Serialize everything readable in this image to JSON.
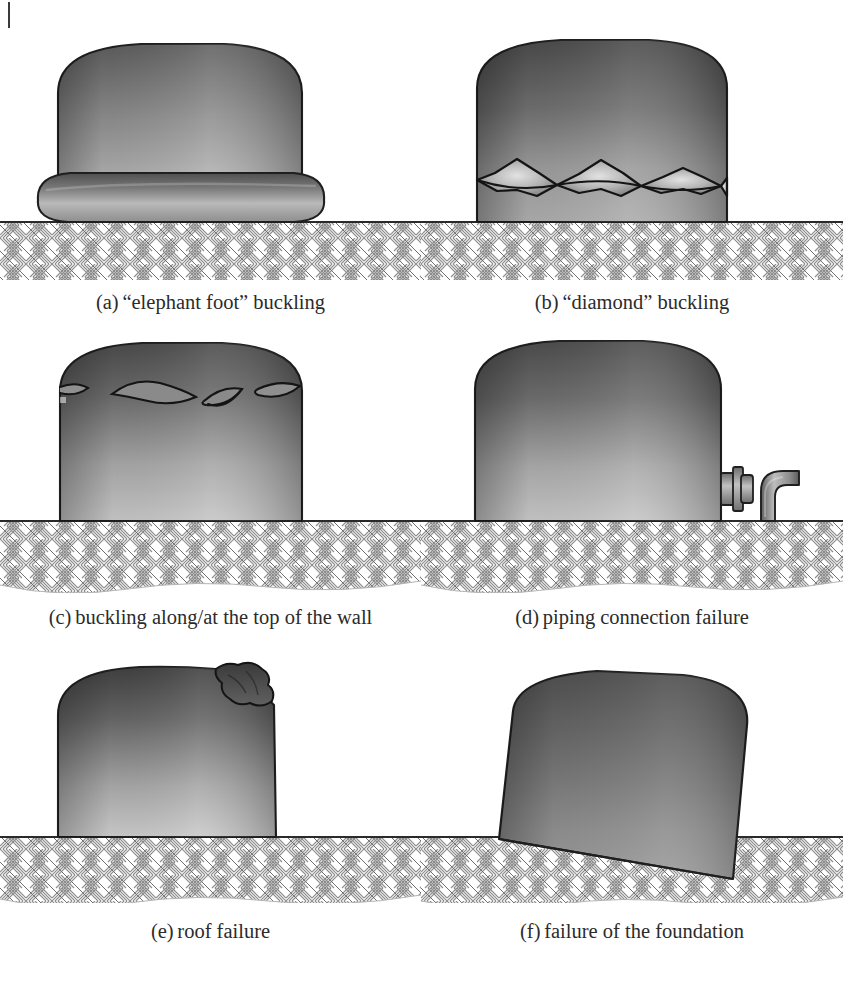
{
  "page": {
    "running_head": "",
    "rule_mark": "vertical-bar"
  },
  "figure": {
    "panel_count": 6,
    "ground_pattern": "basket-weave hatch",
    "colors": {
      "tank_dark": "#565656",
      "tank_mid": "#8a8a8a",
      "tank_light": "#c9c9c9",
      "outline": "#1f1f1f",
      "ground_line": "#2a2a2a",
      "hatch": "#8d8d8d",
      "pipe": "#9a9a9a",
      "background": "#ffffff"
    },
    "panels": [
      {
        "id": "a",
        "label": "(a)",
        "caption": "“elephant foot” buckling",
        "failure_mode": "elephant-foot-buckling",
        "feature": "torus bulge at base of shell"
      },
      {
        "id": "b",
        "label": "(b)",
        "caption": "“diamond” buckling",
        "failure_mode": "diamond-buckling",
        "feature": "chain of diamond lobes around lower shell"
      },
      {
        "id": "c",
        "label": "(c)",
        "caption": "buckling along/at the top of the wall",
        "failure_mode": "top-of-wall-buckling",
        "feature": "lens shaped dents near roof-to-shell junction"
      },
      {
        "id": "d",
        "label": "(d)",
        "caption": "piping connection failure",
        "failure_mode": "piping-connection-failure",
        "feature": "nozzle flange with detached elbow pipe"
      },
      {
        "id": "e",
        "label": "(e)",
        "caption": "roof failure",
        "failure_mode": "roof-failure",
        "feature": "crumpled collapsed roof segment"
      },
      {
        "id": "f",
        "label": "(f)",
        "caption": "failure of the foundation",
        "failure_mode": "foundation-failure",
        "feature": "tank tilted and sunk into soil"
      }
    ]
  }
}
